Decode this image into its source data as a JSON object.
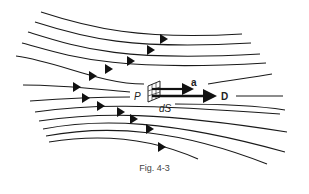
{
  "figure": {
    "caption": "Fig. 4-3",
    "labels": {
      "point": "P",
      "surface_element": "dS",
      "unit_vector": "a",
      "flux_density": "D"
    },
    "colors": {
      "line": "#1a1a1a",
      "background": "#ffffff"
    }
  }
}
